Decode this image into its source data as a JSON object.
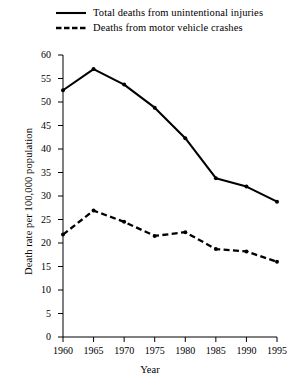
{
  "chart_data": {
    "type": "line",
    "title": "",
    "xlabel": "Year",
    "ylabel": "Death rate per 100,000 population",
    "x": [
      1960,
      1965,
      1970,
      1975,
      1980,
      1985,
      1990,
      1995
    ],
    "xtick_labels": [
      "1960",
      "1965",
      "1970",
      "1975",
      "1980",
      "1985",
      "1990",
      "1995"
    ],
    "xlim": [
      1960,
      1995
    ],
    "ylim": [
      0,
      60
    ],
    "ytick_labels": [
      "0",
      "5",
      "10",
      "15",
      "20",
      "25",
      "30",
      "35",
      "40",
      "45",
      "50",
      "55",
      "60"
    ],
    "yticks": [
      0,
      5,
      10,
      15,
      20,
      25,
      30,
      35,
      40,
      45,
      50,
      55,
      60
    ],
    "grid": false,
    "legend_position": "above-plot",
    "line_color": "#000000",
    "series": [
      {
        "name": "Total deaths from unintentional injuries",
        "style": "solid",
        "marker": "dot",
        "values": [
          52.5,
          57.0,
          53.7,
          48.8,
          42.3,
          33.8,
          32.0,
          28.8
        ]
      },
      {
        "name": "Deaths from motor vehicle crashes",
        "style": "dashed",
        "marker": "dot",
        "values": [
          21.8,
          26.9,
          24.5,
          21.5,
          22.3,
          18.7,
          18.2,
          16.0
        ]
      }
    ]
  }
}
